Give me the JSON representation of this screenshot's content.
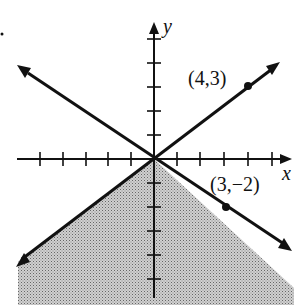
{
  "graph": {
    "type": "linear inequality region",
    "x_axis_label": "x",
    "y_axis_label": "y",
    "points": [
      {
        "label": "(4,3)",
        "x": 4,
        "y": 3
      },
      {
        "label": "(3,−2)",
        "x": 3,
        "y": -2
      }
    ],
    "lines": [
      {
        "name": "y = 3/4 x",
        "style": "solid"
      },
      {
        "name": "y = -2/3 x",
        "style": "solid"
      }
    ],
    "shaded_region": "below both lines",
    "shade_color": "#b8b8b8"
  }
}
